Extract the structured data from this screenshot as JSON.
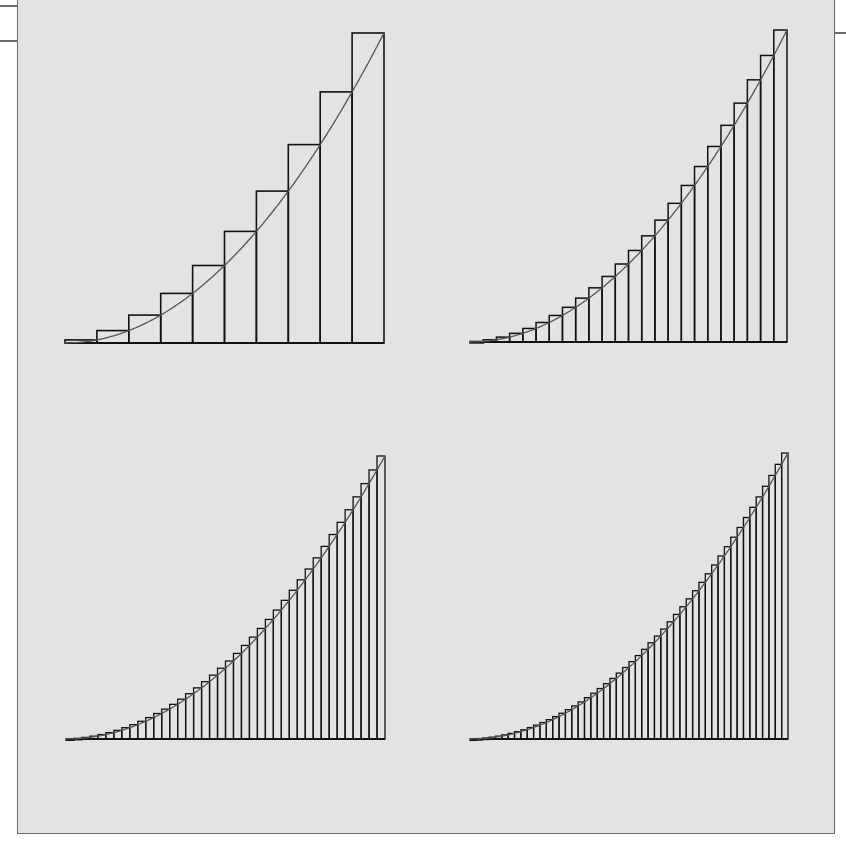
{
  "figure": {
    "background_color": "#e3e3e3",
    "frame_color": "#6a6a6a",
    "bar_stroke_color": "#111111",
    "curve_color": "#555555"
  },
  "chart_data": [
    {
      "type": "bar",
      "title": "",
      "description": "Right-endpoint Riemann sum rectangles under y = x^2 on [0,1], n = 10",
      "function": "x^2",
      "interval": [
        0,
        1
      ],
      "n": 10,
      "method": "right-endpoint",
      "x": [
        0.1,
        0.2,
        0.3,
        0.4,
        0.5,
        0.6,
        0.7,
        0.8,
        0.9,
        1.0
      ],
      "values": [
        0.01,
        0.04,
        0.09,
        0.16,
        0.25,
        0.36,
        0.49,
        0.64,
        0.81,
        1.0
      ],
      "xlabel": "",
      "ylabel": "",
      "ylim": [
        0,
        1
      ],
      "grid": false,
      "panel": {
        "left": 65,
        "right": 384,
        "baseline": 343,
        "top": 33
      }
    },
    {
      "type": "bar",
      "title": "",
      "description": "Right-endpoint Riemann sum rectangles under y = x^2 on [0,1], n = 24",
      "function": "x^2",
      "interval": [
        0,
        1
      ],
      "n": 24,
      "method": "right-endpoint",
      "xlabel": "",
      "ylabel": "",
      "ylim": [
        0,
        1
      ],
      "grid": false,
      "panel": {
        "left": 470,
        "right": 787,
        "baseline": 342,
        "top": 30
      }
    },
    {
      "type": "bar",
      "title": "",
      "description": "Right-endpoint Riemann sum rectangles under y = x^2 on [0,1], n = 40",
      "function": "x^2",
      "interval": [
        0,
        1
      ],
      "n": 40,
      "method": "right-endpoint",
      "xlabel": "",
      "ylabel": "",
      "ylim": [
        0,
        1
      ],
      "grid": false,
      "panel": {
        "left": 66,
        "right": 385,
        "baseline": 739,
        "top": 456
      }
    },
    {
      "type": "bar",
      "title": "",
      "description": "Right-endpoint Riemann sum rectangles under y = x^2 on [0,1], n = 50",
      "function": "x^2",
      "interval": [
        0,
        1
      ],
      "n": 50,
      "method": "right-endpoint",
      "xlabel": "",
      "ylabel": "",
      "ylim": [
        0,
        1
      ],
      "grid": false,
      "panel": {
        "left": 470,
        "right": 788,
        "baseline": 739,
        "top": 453
      }
    }
  ]
}
